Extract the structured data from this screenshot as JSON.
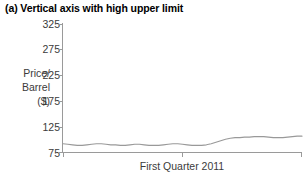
{
  "title": "(a) Vertical axis with high upper limit",
  "chart_data": {
    "type": "line",
    "title": "(a) Vertical axis with high upper limit",
    "xlabel": "First Quarter 2011",
    "ylabel": "Price/ Barrel ($)",
    "ylabel_lines": [
      "Price/",
      "Barrel",
      "($)"
    ],
    "ylim": [
      75,
      325
    ],
    "yticks": [
      325,
      275,
      225,
      175,
      125,
      75
    ],
    "ytick_labels": [
      "325",
      "275",
      "225",
      "175",
      "125",
      "75"
    ],
    "xticks": [
      "",
      "",
      ""
    ],
    "grid": false,
    "legend": false,
    "line_color": "#999999",
    "axis_color": "#9a9a9a",
    "text_color": "#3b3b3b",
    "series": [
      {
        "name": "Price per barrel",
        "x": [
          0,
          2,
          4,
          6,
          8,
          10,
          12,
          14,
          16,
          18,
          20,
          22,
          24,
          26,
          28,
          30,
          32,
          34,
          36,
          38,
          40,
          42,
          44,
          46,
          48,
          50,
          52,
          54,
          56,
          58,
          60,
          62,
          64,
          66,
          68,
          70,
          72,
          74,
          76,
          78,
          80,
          82,
          84,
          86,
          88,
          90,
          92,
          94,
          96,
          98,
          100
        ],
        "values": [
          91,
          90,
          89,
          88,
          88,
          89,
          90,
          91,
          91,
          90,
          89,
          89,
          88,
          88,
          89,
          90,
          90,
          89,
          88,
          88,
          88,
          89,
          90,
          91,
          91,
          90,
          89,
          88,
          88,
          88,
          89,
          91,
          94,
          97,
          100,
          102,
          103,
          103,
          104,
          104,
          105,
          105,
          105,
          104,
          103,
          103,
          103,
          104,
          105,
          106,
          106
        ]
      }
    ]
  },
  "axis": {
    "y_title_lines": [
      "Price/",
      "Barrel",
      "($)"
    ],
    "x_title": "First Quarter 2011"
  }
}
